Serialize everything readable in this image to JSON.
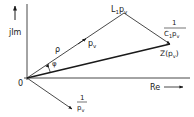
{
  "diagram": {
    "type": "phasor-diagram",
    "axes": {
      "imag_label": "jIm",
      "real_label": "Re",
      "origin_label": "0"
    },
    "vectors": [
      {
        "name": "p_v",
        "label_main": "p",
        "label_sub": "v",
        "from": [
          27,
          78
        ],
        "to": [
          124,
          13
        ]
      },
      {
        "name": "L1_p_v",
        "label_main": "L",
        "label_sub1": "1",
        "label_mid": "p",
        "label_sub2": "v",
        "from": [
          124,
          13
        ],
        "to": [
          124,
          13
        ]
      },
      {
        "name": "one_over_C1_p_v",
        "numerator": "1",
        "den_main1": "C",
        "den_sub1": "1",
        "den_main2": "p",
        "den_sub2": "v",
        "from": [
          124,
          13
        ],
        "to": [
          170,
          44
        ]
      },
      {
        "name": "Z_p_v",
        "label_main": "Z(p",
        "label_sub": "v",
        "label_close": ")",
        "from": [
          27,
          78
        ],
        "to": [
          170,
          44
        ]
      },
      {
        "name": "one_over_p_v",
        "numerator": "1",
        "den_main": "p",
        "den_sub": "v",
        "from": [
          27,
          78
        ],
        "to": [
          72,
          110
        ]
      }
    ],
    "labels": {
      "rho": "ρ",
      "phi": "φ"
    },
    "color": "#1a1a1a"
  }
}
